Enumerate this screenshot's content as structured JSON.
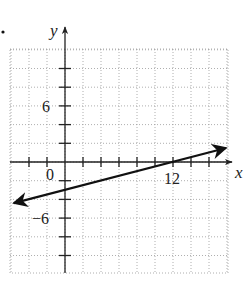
{
  "chart_data": {
    "type": "line",
    "title": "",
    "xlabel": "x",
    "ylabel": "y",
    "xlim": [
      -6,
      18
    ],
    "ylim": [
      -12,
      12
    ],
    "grid": true,
    "grid_step": 2,
    "tick_step": 2,
    "tick_labels": {
      "x": [
        {
          "value": 0,
          "label": "0"
        },
        {
          "value": 12,
          "label": "12"
        }
      ],
      "y": [
        {
          "value": 6,
          "label": "6"
        },
        {
          "value": -6,
          "label": "−6"
        }
      ]
    },
    "series": [
      {
        "name": "line",
        "equation": "y = x/4 - 3",
        "slope": 0.25,
        "intercept": -3,
        "x": [
          -5.7,
          17.9
        ],
        "y": [
          -4.4,
          1.5
        ],
        "arrows": "both"
      }
    ],
    "points_of_interest": [
      {
        "label": "x-intercept",
        "x": 12,
        "y": 0
      },
      {
        "label": "y-intercept",
        "x": 0,
        "y": -3
      }
    ]
  },
  "labels": {
    "x_axis": "x",
    "y_axis": "y",
    "origin": "0",
    "x12": "12",
    "y6": "6",
    "yneg6": "−6",
    "bullet": "."
  },
  "colors": {
    "grid": "#9a9a9a",
    "axis": "#222222",
    "line": "#111111"
  }
}
